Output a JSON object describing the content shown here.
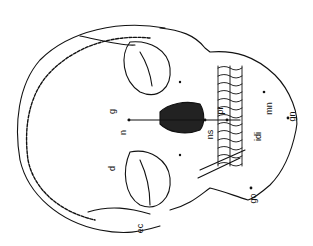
{
  "figure": {
    "labels": [
      {
        "id": "g",
        "text": "g",
        "x": 113,
        "y": 113
      },
      {
        "id": "n",
        "text": "n",
        "x": 122,
        "y": 131
      },
      {
        "id": "d",
        "text": "d",
        "x": 112,
        "y": 168
      },
      {
        "id": "ec",
        "text": "ec",
        "x": 140,
        "y": 226
      },
      {
        "id": "ns",
        "text": "ns",
        "x": 208,
        "y": 133
      },
      {
        "id": "pr",
        "text": "pr",
        "x": 218,
        "y": 110
      },
      {
        "id": "idi",
        "text": "idi",
        "x": 258,
        "y": 134
      },
      {
        "id": "mn",
        "text": "mn",
        "x": 266,
        "y": 108
      },
      {
        "id": "gn",
        "text": "gn",
        "x": 290,
        "y": 116
      },
      {
        "id": "go",
        "text": "go",
        "x": 251,
        "y": 196
      }
    ]
  }
}
